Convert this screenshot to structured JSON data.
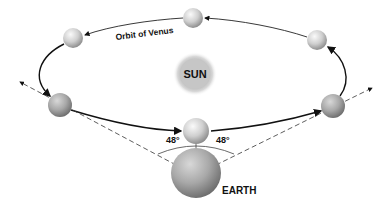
{
  "diagram": {
    "orbit_label": "Orbit of Venus",
    "sun_label": "SUN",
    "earth_label": "EARTH",
    "angle_left": "48°",
    "angle_right": "48°",
    "colors": {
      "background": "#ffffff",
      "line": "#111111",
      "sphere_light": "#f4f4f4",
      "sphere_dark": "#8a8a8a"
    }
  }
}
